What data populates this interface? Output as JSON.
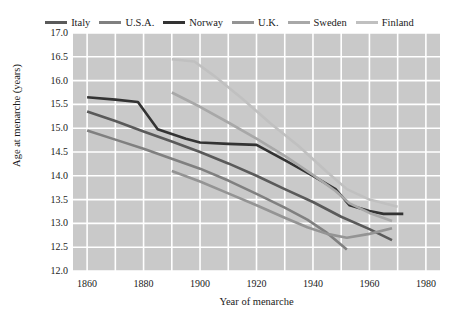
{
  "chart_data": {
    "type": "line",
    "title": "",
    "xlabel": "Year of menarche",
    "ylabel": "Age at menarche (years)",
    "xlim": [
      1855,
      1985
    ],
    "ylim": [
      12.0,
      17.0
    ],
    "xticks": [
      1860,
      1880,
      1900,
      1920,
      1940,
      1960,
      1980
    ],
    "yticks": [
      "17.0",
      "16.5",
      "16.0",
      "15.5",
      "15.0",
      "14.5",
      "14.0",
      "13.5",
      "13.0",
      "12.5",
      "12.0"
    ],
    "grid": true,
    "legend_position": "top-center",
    "plot_background": "#c9c9c9",
    "grid_color": "#ffffff",
    "series": [
      {
        "name": "Italy",
        "color": "#5a5a5a",
        "points": [
          [
            1860,
            15.35
          ],
          [
            1870,
            15.15
          ],
          [
            1880,
            14.93
          ],
          [
            1890,
            14.72
          ],
          [
            1900,
            14.5
          ],
          [
            1910,
            14.26
          ],
          [
            1920,
            14.0
          ],
          [
            1930,
            13.72
          ],
          [
            1940,
            13.45
          ],
          [
            1950,
            13.14
          ],
          [
            1960,
            12.88
          ],
          [
            1968,
            12.65
          ]
        ]
      },
      {
        "name": "U.S.A.",
        "color": "#808080",
        "points": [
          [
            1860,
            14.95
          ],
          [
            1870,
            14.76
          ],
          [
            1880,
            14.57
          ],
          [
            1890,
            14.36
          ],
          [
            1900,
            14.15
          ],
          [
            1910,
            13.9
          ],
          [
            1920,
            13.62
          ],
          [
            1930,
            13.33
          ],
          [
            1938,
            13.08
          ],
          [
            1945,
            12.8
          ],
          [
            1952,
            12.45
          ]
        ]
      },
      {
        "name": "Norway",
        "color": "#333333",
        "points": [
          [
            1860,
            15.65
          ],
          [
            1870,
            15.6
          ],
          [
            1878,
            15.55
          ],
          [
            1885,
            14.98
          ],
          [
            1895,
            14.78
          ],
          [
            1900,
            14.7
          ],
          [
            1910,
            14.67
          ],
          [
            1920,
            14.65
          ],
          [
            1930,
            14.33
          ],
          [
            1940,
            14.0
          ],
          [
            1948,
            13.72
          ],
          [
            1953,
            13.38
          ],
          [
            1960,
            13.26
          ],
          [
            1965,
            13.2
          ],
          [
            1972,
            13.2
          ]
        ]
      },
      {
        "name": "U.K.",
        "color": "#949494",
        "points": [
          [
            1890,
            14.1
          ],
          [
            1900,
            13.88
          ],
          [
            1910,
            13.63
          ],
          [
            1920,
            13.38
          ],
          [
            1930,
            13.12
          ],
          [
            1938,
            12.92
          ],
          [
            1945,
            12.78
          ],
          [
            1952,
            12.7
          ],
          [
            1960,
            12.78
          ],
          [
            1968,
            12.9
          ]
        ]
      },
      {
        "name": "Sweden",
        "color": "#a8a8a8",
        "points": [
          [
            1890,
            15.75
          ],
          [
            1900,
            15.45
          ],
          [
            1910,
            15.12
          ],
          [
            1920,
            14.78
          ],
          [
            1930,
            14.42
          ],
          [
            1940,
            14.02
          ],
          [
            1948,
            13.68
          ],
          [
            1953,
            13.42
          ],
          [
            1960,
            13.22
          ],
          [
            1968,
            13.05
          ]
        ]
      },
      {
        "name": "Finland",
        "color": "#c0c0c0",
        "points": [
          [
            1890,
            16.45
          ],
          [
            1898,
            16.4
          ],
          [
            1905,
            16.1
          ],
          [
            1915,
            15.62
          ],
          [
            1925,
            15.1
          ],
          [
            1935,
            14.62
          ],
          [
            1945,
            14.08
          ],
          [
            1952,
            13.72
          ],
          [
            1960,
            13.5
          ],
          [
            1970,
            13.35
          ]
        ]
      }
    ]
  },
  "legend": {
    "items": [
      {
        "label": "Italy",
        "color": "#5a5a5a"
      },
      {
        "label": "U.S.A.",
        "color": "#808080"
      },
      {
        "label": "Norway",
        "color": "#333333"
      },
      {
        "label": "U.K.",
        "color": "#949494"
      },
      {
        "label": "Sweden",
        "color": "#a8a8a8"
      },
      {
        "label": "Finland",
        "color": "#c0c0c0"
      }
    ]
  },
  "axes": {
    "y_title": "Age at menarche (years)",
    "x_title": "Year of menarche"
  }
}
